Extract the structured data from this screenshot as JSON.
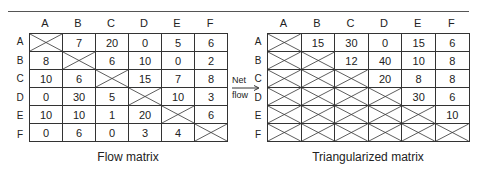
{
  "columns": [
    "A",
    "B",
    "C",
    "D",
    "E",
    "F"
  ],
  "rows": [
    "A",
    "B",
    "C",
    "D",
    "E",
    "F"
  ],
  "flow_matrix": {
    "caption": "Flow matrix",
    "cells": [
      [
        "X",
        "7",
        "20",
        "0",
        "5",
        "6"
      ],
      [
        "8",
        "X",
        "6",
        "10",
        "0",
        "2"
      ],
      [
        "10",
        "6",
        "X",
        "15",
        "7",
        "8"
      ],
      [
        "0",
        "30",
        "5",
        "X",
        "10",
        "3"
      ],
      [
        "10",
        "10",
        "1",
        "20",
        "X",
        "6"
      ],
      [
        "0",
        "6",
        "0",
        "3",
        "4",
        "X"
      ]
    ]
  },
  "connector": {
    "label_line1": "Net",
    "label_line2": "flow"
  },
  "triangularized_matrix": {
    "caption": "Triangularized matrix",
    "cells": [
      [
        "X",
        "15",
        "30",
        "0",
        "15",
        "6"
      ],
      [
        "X",
        "X",
        "12",
        "40",
        "10",
        "8"
      ],
      [
        "X",
        "X",
        "X",
        "20",
        "8",
        "8"
      ],
      [
        "X",
        "X",
        "X",
        "X",
        "30",
        "6"
      ],
      [
        "X",
        "X",
        "X",
        "X",
        "X",
        "10"
      ],
      [
        "X",
        "X",
        "X",
        "X",
        "X",
        "X"
      ]
    ]
  }
}
